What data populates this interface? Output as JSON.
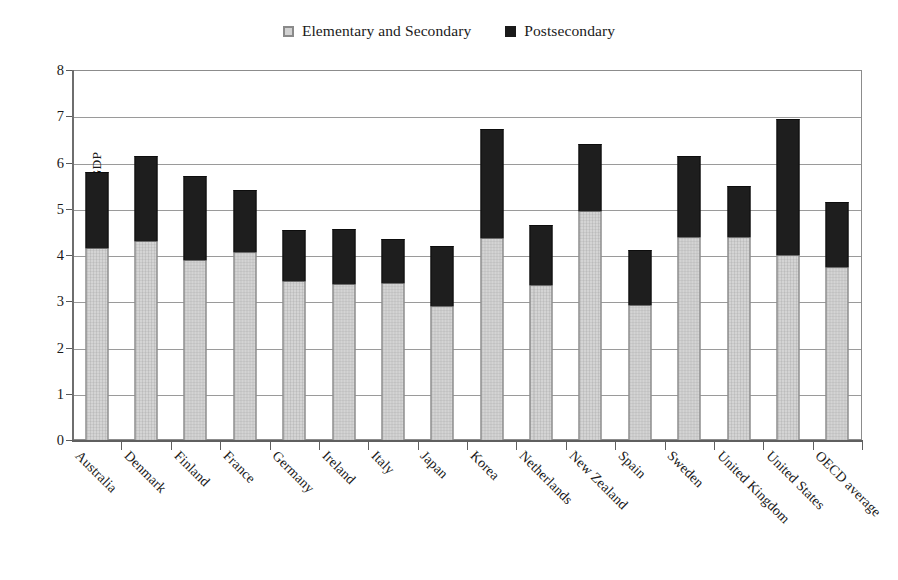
{
  "chart_data": {
    "type": "bar",
    "subtype": "stacked-vertical",
    "title": "",
    "xlabel": "",
    "ylabel": "Percent of GDP",
    "ylim": [
      0,
      8
    ],
    "ytick_step": 1,
    "yticks": [
      "0",
      "1",
      "2",
      "3",
      "4",
      "5",
      "6",
      "7",
      "8"
    ],
    "grid": "horizontal",
    "legend_position": "top-center",
    "categories": [
      "Australia",
      "Denmark",
      "Finland",
      "France",
      "Germany",
      "Ireland",
      "Italy",
      "Japan",
      "Korea",
      "Netherlands",
      "New Zealand",
      "Spain",
      "Sweden",
      "United Kingdom",
      "United States",
      "OECD average"
    ],
    "series": [
      {
        "name": "Elementary and Secondary",
        "color": "#d4d4d4",
        "values": [
          4.15,
          4.3,
          3.9,
          4.07,
          3.43,
          3.38,
          3.4,
          2.9,
          4.37,
          3.35,
          4.95,
          2.93,
          4.4,
          4.38,
          4.0,
          3.75
        ]
      },
      {
        "name": "Postsecondary",
        "color": "#1e1e1e",
        "values": [
          1.65,
          1.85,
          1.8,
          1.33,
          1.12,
          1.19,
          0.95,
          1.3,
          2.36,
          1.3,
          1.45,
          1.17,
          1.75,
          1.12,
          2.95,
          1.4
        ]
      }
    ],
    "totals": [
      5.8,
      6.15,
      5.7,
      5.4,
      4.55,
      4.57,
      4.35,
      4.2,
      6.73,
      4.65,
      6.4,
      4.1,
      6.15,
      5.5,
      6.95,
      5.15
    ]
  },
  "legend": {
    "entries": [
      {
        "label": "Elementary and Secondary",
        "swatch": "light-gray-square"
      },
      {
        "label": "Postsecondary",
        "swatch": "black-square"
      }
    ]
  },
  "axes": {
    "y_title": "Percent of GDP"
  }
}
